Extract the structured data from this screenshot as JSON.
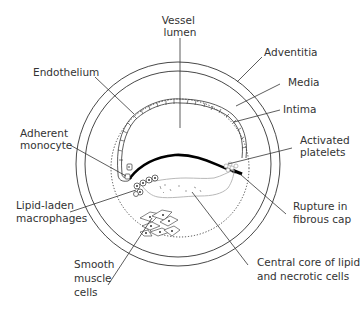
{
  "diagram": {
    "colors": {
      "line": "#333333",
      "text": "#333333",
      "lipid_core_outline": "#b0b0b0",
      "fibrous_cap": "#000000",
      "background": "#ffffff"
    },
    "labels": {
      "vessel_lumen": [
        "Vessel",
        "lumen"
      ],
      "adventitia": [
        "Adventitia"
      ],
      "media": [
        "Media"
      ],
      "intima": [
        "Intima"
      ],
      "endothelium": [
        "Endothelium"
      ],
      "adherent_monocyte": [
        "Adherent",
        "monocyte"
      ],
      "activated_platelets": [
        "Activated",
        "platelets"
      ],
      "lipid_laden_macrophages": [
        "Lipid-laden",
        "macrophages"
      ],
      "rupture_in_fibrous_cap": [
        "Rupture in",
        "fibrous cap"
      ],
      "smooth_muscle_cells": [
        "Smooth",
        "muscle",
        "cells"
      ],
      "central_core": [
        "Central core of lipid",
        "and necrotic cells"
      ]
    }
  }
}
